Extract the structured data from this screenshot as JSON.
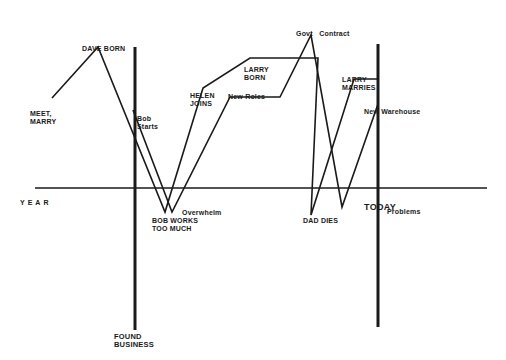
{
  "diagram": {
    "type": "timeline-life-line",
    "axis": {
      "label": "YEAR",
      "y": 188,
      "x_start": 35,
      "x_end": 487
    },
    "markers": [
      {
        "id": "found-business",
        "label": "FOUND\nBUSINESS",
        "x": 135,
        "y_top": 47,
        "y_bottom": 330
      },
      {
        "id": "today",
        "label": "TODAY",
        "x": 378,
        "y_top": 44,
        "y_bottom": 327
      }
    ],
    "events": [
      {
        "id": "meet-marry",
        "label": "MEET,\nMARRY",
        "x": 30,
        "y": 110
      },
      {
        "id": "dave-born",
        "label": "DAVE BORN",
        "x": 82,
        "y": 45
      },
      {
        "id": "bob-starts",
        "label": "Bob\nStarts",
        "x": 137,
        "y": 115
      },
      {
        "id": "helen-joins",
        "label": "HELEN\nJOINS",
        "x": 190,
        "y": 92
      },
      {
        "id": "new-roles",
        "label": "New Roles",
        "x": 228,
        "y": 93
      },
      {
        "id": "larry-born",
        "label": "LARRY\nBORN",
        "x": 244,
        "y": 67
      },
      {
        "id": "govt-contract",
        "label": "Govt   Contract",
        "x": 296,
        "y": 30
      },
      {
        "id": "larry-marries",
        "label": "LARRY\nMARRIES",
        "x": 342,
        "y": 76
      },
      {
        "id": "new-warehouse",
        "label": "New Warehouse",
        "x": 364,
        "y": 108
      },
      {
        "id": "overwhelm",
        "label": "Overwhelm",
        "x": 182,
        "y": 209
      },
      {
        "id": "bob-works-too-much",
        "label": "BOB WORKS\nTOO MUCH",
        "x": 152,
        "y": 216
      },
      {
        "id": "dad-dies",
        "label": "DAD DIES",
        "x": 303,
        "y": 217
      },
      {
        "id": "problems",
        "label": "Problems",
        "x": 387,
        "y": 208
      }
    ],
    "paths": [
      {
        "id": "family-line",
        "points": [
          [
            52,
            98
          ],
          [
            98,
            47
          ],
          [
            165,
            212
          ],
          [
            203,
            88
          ],
          [
            250,
            58
          ],
          [
            318,
            58
          ],
          [
            311,
            215
          ],
          [
            354,
            79
          ],
          [
            378,
            79
          ]
        ]
      },
      {
        "id": "business-line",
        "points": [
          [
            133,
            110
          ],
          [
            172,
            212
          ],
          [
            230,
            97
          ],
          [
            280,
            97
          ],
          [
            311,
            35
          ],
          [
            342,
            207
          ],
          [
            378,
            104
          ]
        ]
      }
    ],
    "colors": {
      "line": "#1a1a1a",
      "background": "#ffffff"
    }
  }
}
